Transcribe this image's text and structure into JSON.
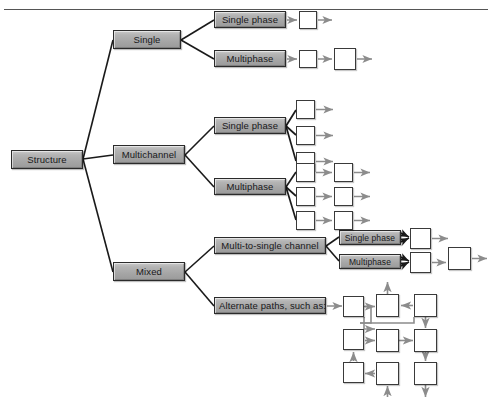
{
  "figure": {
    "type": "tree-diagram",
    "title_rule": true,
    "root": "Structure",
    "accent_box_fill": "#a6a6a6",
    "accent_box_border": "#2b2b2b",
    "node_border": "#3a3a3a",
    "connector_color": "#1a1a1a",
    "arrow_color": "#8c8c8c"
  },
  "nodes": {
    "root": {
      "label": "Structure",
      "x": 11,
      "y": 150,
      "w": 72,
      "h": 19
    },
    "branches": [
      {
        "name": "single",
        "label": "Single",
        "x": 113,
        "y": 30,
        "w": 68,
        "h": 19
      },
      {
        "name": "multichannel",
        "label": "Multichannel",
        "x": 113,
        "y": 145,
        "w": 72,
        "h": 19
      },
      {
        "name": "mixed",
        "label": "Mixed",
        "x": 113,
        "y": 262,
        "w": 72,
        "h": 19
      }
    ],
    "leaves": [
      {
        "name": "single-singlephase",
        "label": "Single phase",
        "x": 214,
        "y": 11,
        "w": 72,
        "h": 17
      },
      {
        "name": "single-multiphase",
        "label": "Multiphase",
        "x": 214,
        "y": 50,
        "w": 72,
        "h": 17
      },
      {
        "name": "multichannel-singlephase",
        "label": "Single phase",
        "x": 214,
        "y": 117,
        "w": 72,
        "h": 17
      },
      {
        "name": "multichannel-multiphase",
        "label": "Multiphase",
        "x": 214,
        "y": 178,
        "w": 72,
        "h": 17
      },
      {
        "name": "multi-to-single-channel",
        "label": "Multi-to-single channel",
        "x": 214,
        "y": 237,
        "w": 112,
        "h": 17
      },
      {
        "name": "alternate-paths",
        "label": "Alternate paths, such as:",
        "x": 214,
        "y": 297,
        "w": 112,
        "h": 17
      },
      {
        "name": "mts-singlephase",
        "label": "Single phase",
        "x": 339,
        "y": 230,
        "w": 62,
        "h": 15
      },
      {
        "name": "mts-multiphase",
        "label": "Multiphase",
        "x": 339,
        "y": 254,
        "w": 62,
        "h": 15
      }
    ]
  },
  "squares": {
    "single_singlephase": [
      {
        "x": 299,
        "y": 11,
        "s": 18
      }
    ],
    "single_multiphase": [
      {
        "x": 299,
        "y": 50,
        "s": 18
      },
      {
        "x": 334,
        "y": 48,
        "s": 22
      }
    ],
    "multichannel_singlephase": [
      {
        "x": 296,
        "y": 100,
        "s": 19
      },
      {
        "x": 296,
        "y": 126,
        "s": 19
      },
      {
        "x": 296,
        "y": 152,
        "s": 19
      }
    ],
    "multichannel_multiphase": [
      {
        "x": 296,
        "y": 163,
        "s": 19
      },
      {
        "x": 296,
        "y": 187,
        "s": 19
      },
      {
        "x": 296,
        "y": 211,
        "s": 19
      },
      {
        "x": 334,
        "y": 163,
        "s": 19
      },
      {
        "x": 334,
        "y": 187,
        "s": 19
      },
      {
        "x": 334,
        "y": 211,
        "s": 19
      }
    ],
    "multi_to_single": [
      {
        "x": 410,
        "y": 228,
        "s": 21
      },
      {
        "x": 410,
        "y": 252,
        "s": 21
      },
      {
        "x": 448,
        "y": 247,
        "s": 23
      }
    ],
    "alternate_paths_grid": [
      {
        "x": 343,
        "y": 296,
        "s": 21
      },
      {
        "x": 376,
        "y": 294,
        "s": 23
      },
      {
        "x": 414,
        "y": 294,
        "s": 23
      },
      {
        "x": 343,
        "y": 329,
        "s": 21
      },
      {
        "x": 376,
        "y": 329,
        "s": 23
      },
      {
        "x": 414,
        "y": 329,
        "s": 23
      },
      {
        "x": 343,
        "y": 362,
        "s": 21
      },
      {
        "x": 376,
        "y": 362,
        "s": 23
      },
      {
        "x": 414,
        "y": 362,
        "s": 23
      }
    ]
  }
}
